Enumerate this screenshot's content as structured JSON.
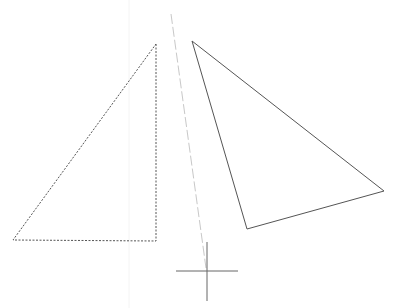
{
  "canvas": {
    "width": 397,
    "height": 308,
    "background": "#ffffff",
    "guide_vertical_line": {
      "x": 129,
      "y1": 0,
      "y2": 308,
      "color": "#f4f4f4"
    },
    "original_triangle": {
      "style": "dashed",
      "color": "#555555",
      "points": [
        [
          156,
          44
        ],
        [
          156,
          241
        ],
        [
          13,
          240
        ]
      ]
    },
    "rotated_triangle": {
      "style": "solid",
      "color": "#555555",
      "points": [
        [
          192,
          41
        ],
        [
          384,
          191
        ],
        [
          247,
          229
        ]
      ]
    },
    "rotation_guide": {
      "style": "dashed",
      "color": "#c8c8c8",
      "from": [
        171,
        14
      ],
      "to": [
        206,
        268
      ]
    },
    "cursor": {
      "type": "crosshair",
      "center": [
        207,
        271
      ],
      "h_from": 176,
      "h_to": 238,
      "v_from": 242,
      "v_to": 301,
      "color": "#666666"
    }
  }
}
